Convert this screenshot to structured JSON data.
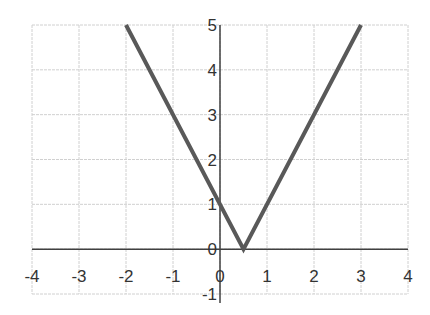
{
  "chart_data": {
    "type": "line",
    "title": "",
    "xlabel": "",
    "ylabel": "",
    "xlim": [
      -4,
      4
    ],
    "ylim": [
      -1,
      5
    ],
    "grid": true,
    "legend": null,
    "x_ticks": [
      "-4",
      "-3",
      "-2",
      "-1",
      "0",
      "1",
      "2",
      "3",
      "4"
    ],
    "y_ticks": [
      "-1",
      "0",
      "1",
      "2",
      "3",
      "4",
      "5"
    ],
    "series": [
      {
        "name": "y = |2x - 1|",
        "color": "#595959",
        "x": [
          -2,
          0.5,
          3
        ],
        "y": [
          5,
          0,
          5
        ]
      }
    ]
  },
  "colors": {
    "grid": "#d0d0d0",
    "axis": "#404040",
    "line": "#595959",
    "tick_text": "#333333"
  }
}
